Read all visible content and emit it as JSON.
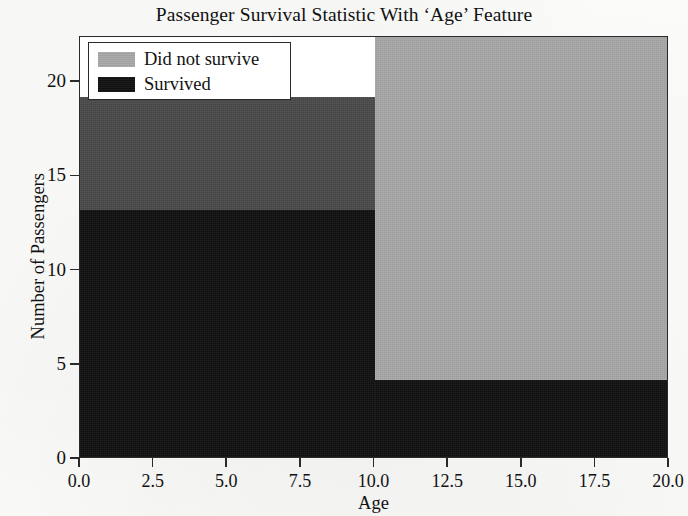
{
  "chart_data": {
    "type": "bar",
    "title": "Passenger Survival Statistic With ‘Age’ Feature",
    "xlabel": "Age",
    "ylabel": "Number of Passengers",
    "xlim": [
      0.0,
      20.0
    ],
    "ylim": [
      0,
      22.4
    ],
    "grid": false,
    "legend_position": "upper left",
    "xticks": [
      "0.0",
      "2.5",
      "5.0",
      "7.5",
      "10.0",
      "12.5",
      "15.0",
      "17.5",
      "20.0"
    ],
    "xtick_values": [
      0.0,
      2.5,
      5.0,
      7.5,
      10.0,
      12.5,
      15.0,
      17.5,
      20.0
    ],
    "yticks": [
      "0",
      "5",
      "10",
      "15",
      "20"
    ],
    "ytick_values": [
      0,
      5,
      10,
      15,
      20
    ],
    "bins": [
      {
        "label": "0-10",
        "x_start": 0.0,
        "x_end": 10.0
      },
      {
        "label": "10-20",
        "x_start": 10.0,
        "x_end": 20.0
      }
    ],
    "series": [
      {
        "name": "Did not survive",
        "color": "#a8a8a8",
        "values": [
          19.2,
          22.4
        ]
      },
      {
        "name": "Survived",
        "color": "#111111",
        "values": [
          13.2,
          4.2
        ]
      }
    ],
    "overlap_color": "#4a4a4a",
    "note_rendering": "overlapping histogram: 'Survived' black bars drawn over light gray 'Did not survive' bars"
  },
  "legend": {
    "items": [
      {
        "label": "Did not survive",
        "swatch_color": "#a8a8a8"
      },
      {
        "label": "Survived",
        "swatch_color": "#111111"
      }
    ]
  },
  "axes": {
    "y_title": "Number of Passengers",
    "x_title": "Age",
    "y_tick_labels": [
      "0",
      "5",
      "10",
      "15",
      "20"
    ],
    "x_tick_labels": [
      "0.0",
      "2.5",
      "5.0",
      "7.5",
      "10.0",
      "12.5",
      "15.0",
      "17.5",
      "20.0"
    ]
  },
  "header": {
    "full_title": "Passenger Survival Statistic With ‘Age’ Feature"
  }
}
